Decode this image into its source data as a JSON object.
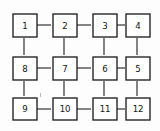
{
  "diagram": {
    "canvas": {
      "width": 160,
      "height": 131,
      "background": "#fdfdfd"
    },
    "style": {
      "node_fill": "#ffffff",
      "node_stroke": "#1f1f1f",
      "edge_stroke": "#2b2b2b",
      "label_color": "#141414"
    },
    "layout": {
      "rows": 3,
      "cols": 4,
      "numbering": "serpentine"
    },
    "nodes": [
      {
        "id": "n1",
        "label": "1",
        "row": 0,
        "col": 0,
        "cx": 24,
        "cy": 25
      },
      {
        "id": "n2",
        "label": "2",
        "row": 0,
        "col": 1,
        "cx": 64,
        "cy": 25
      },
      {
        "id": "n3",
        "label": "3",
        "row": 0,
        "col": 2,
        "cx": 104,
        "cy": 25
      },
      {
        "id": "n4",
        "label": "4",
        "row": 0,
        "col": 3,
        "cx": 137,
        "cy": 25
      },
      {
        "id": "n8",
        "label": "8",
        "row": 1,
        "col": 0,
        "cx": 24,
        "cy": 68
      },
      {
        "id": "n7",
        "label": "7",
        "row": 1,
        "col": 1,
        "cx": 64,
        "cy": 68
      },
      {
        "id": "n6",
        "label": "6",
        "row": 1,
        "col": 2,
        "cx": 104,
        "cy": 68
      },
      {
        "id": "n5",
        "label": "5",
        "row": 1,
        "col": 3,
        "cx": 137,
        "cy": 68
      },
      {
        "id": "n9",
        "label": "9",
        "row": 2,
        "col": 0,
        "cx": 24,
        "cy": 109
      },
      {
        "id": "n10",
        "label": "10",
        "row": 2,
        "col": 1,
        "cx": 64,
        "cy": 109
      },
      {
        "id": "n11",
        "label": "11",
        "row": 2,
        "col": 2,
        "cx": 104,
        "cy": 109
      },
      {
        "id": "n12",
        "label": "12",
        "row": 2,
        "col": 3,
        "cx": 137,
        "cy": 109
      }
    ],
    "edges": [
      {
        "from": "1",
        "to": "2",
        "orientation": "horizontal"
      },
      {
        "from": "2",
        "to": "3",
        "orientation": "horizontal"
      },
      {
        "from": "3",
        "to": "4",
        "orientation": "horizontal"
      },
      {
        "from": "8",
        "to": "7",
        "orientation": "horizontal"
      },
      {
        "from": "7",
        "to": "6",
        "orientation": "horizontal"
      },
      {
        "from": "6",
        "to": "5",
        "orientation": "horizontal"
      },
      {
        "from": "9",
        "to": "10",
        "orientation": "horizontal"
      },
      {
        "from": "10",
        "to": "11",
        "orientation": "horizontal"
      },
      {
        "from": "11",
        "to": "12",
        "orientation": "horizontal"
      },
      {
        "from": "1",
        "to": "8",
        "orientation": "vertical"
      },
      {
        "from": "2",
        "to": "7",
        "orientation": "vertical"
      },
      {
        "from": "3",
        "to": "6",
        "orientation": "vertical"
      },
      {
        "from": "4",
        "to": "5",
        "orientation": "vertical"
      },
      {
        "from": "8",
        "to": "9",
        "orientation": "vertical"
      },
      {
        "from": "7",
        "to": "10",
        "orientation": "vertical"
      },
      {
        "from": "6",
        "to": "11",
        "orientation": "vertical"
      },
      {
        "from": "5",
        "to": "12",
        "orientation": "vertical"
      }
    ]
  }
}
